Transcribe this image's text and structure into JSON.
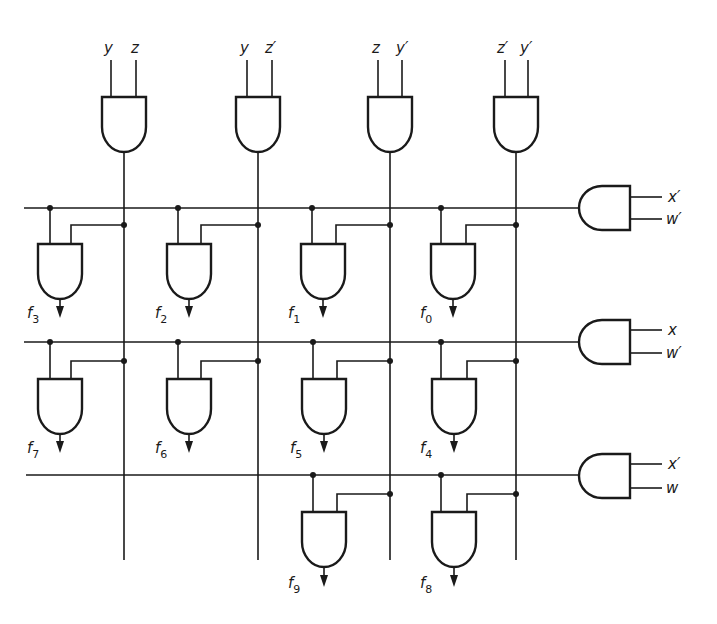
{
  "diagram": {
    "type": "two-level decoder (AND-gate matrix)",
    "colors": {
      "ink": "#1a1a1a",
      "background": "#ffffff"
    },
    "column_gates": [
      {
        "id": "col0",
        "inputs": [
          "y",
          "z"
        ],
        "input_labels": {
          "a": "y",
          "b": "z"
        }
      },
      {
        "id": "col1",
        "inputs": [
          "y",
          "z'"
        ],
        "input_labels": {
          "a": "y",
          "b": "z′"
        }
      },
      {
        "id": "col2",
        "inputs": [
          "z",
          "y'"
        ],
        "input_labels": {
          "a": "z",
          "b": "y′"
        }
      },
      {
        "id": "col3",
        "inputs": [
          "z'",
          "y'"
        ],
        "input_labels": {
          "a": "z′",
          "b": "y′"
        }
      }
    ],
    "row_gates": [
      {
        "id": "row0",
        "inputs": [
          "x'",
          "w'"
        ],
        "input_labels": {
          "a": "x′",
          "b": "w′"
        }
      },
      {
        "id": "row1",
        "inputs": [
          "x",
          "w'"
        ],
        "input_labels": {
          "a": "x",
          "b": "w′"
        }
      },
      {
        "id": "row2",
        "inputs": [
          "x'",
          "w"
        ],
        "input_labels": {
          "a": "x′",
          "b": "w"
        }
      }
    ],
    "outputs": {
      "row0": [
        {
          "f": "f",
          "n": "3"
        },
        {
          "f": "f",
          "n": "2"
        },
        {
          "f": "f",
          "n": "1"
        },
        {
          "f": "f",
          "n": "0"
        }
      ],
      "row1": [
        {
          "f": "f",
          "n": "7"
        },
        {
          "f": "f",
          "n": "6"
        },
        {
          "f": "f",
          "n": "5"
        },
        {
          "f": "f",
          "n": "4"
        }
      ],
      "row2": [
        {
          "f": "f",
          "n": "9"
        },
        {
          "f": "f",
          "n": "8"
        }
      ]
    },
    "caption": ""
  }
}
